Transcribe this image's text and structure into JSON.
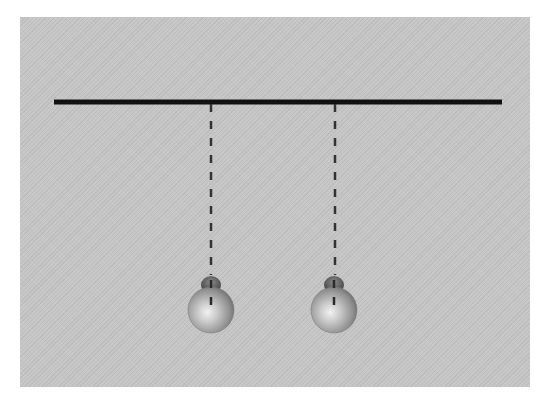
{
  "diagram": {
    "background_color": "#c6c6c6",
    "bar": {
      "x1": 54,
      "x2": 502,
      "y": 102,
      "thickness": 5,
      "color": "#111111"
    },
    "pendulums": [
      {
        "id": "left",
        "pivot_x": 211,
        "pivot_y": 104,
        "bob_cx": 211,
        "bob_cy": 310,
        "bob_r": 23
      },
      {
        "id": "right",
        "pivot_x": 335,
        "pivot_y": 104,
        "bob_cx": 334,
        "bob_cy": 310,
        "bob_r": 23
      }
    ],
    "string_style": {
      "dash": 8,
      "gap": 9,
      "color": "#333333",
      "width": 2.5
    }
  }
}
